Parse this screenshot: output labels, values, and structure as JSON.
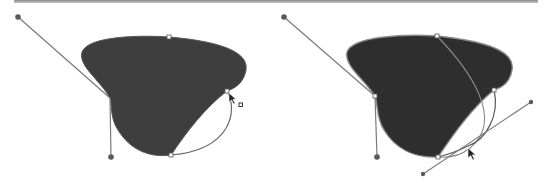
{
  "diagram": {
    "colors": {
      "fill": "#3e3e3e",
      "stroke": "#6a6a6a",
      "handle_dot": "#5a5a5a",
      "anchor": "#ffffff",
      "background": "#ffffff",
      "top_rule": "#9a9a9a"
    },
    "panels": [
      {
        "id": "before",
        "label": "Shape with curve segment selected",
        "anchors": [
          {
            "name": "left-anchor",
            "x": 110,
            "y": 98
          },
          {
            "name": "top-anchor",
            "x": 169,
            "y": 37
          },
          {
            "name": "right-anchor",
            "x": 227,
            "y": 91
          },
          {
            "name": "bottom-anchor",
            "x": 171,
            "y": 155
          }
        ],
        "handles": [
          {
            "from": [
              110,
              98
            ],
            "to": [
              18,
              17
            ]
          },
          {
            "from": [
              110,
              98
            ],
            "to": [
              111,
              157
            ]
          }
        ],
        "cursor": {
          "type": "direct-select-with-square",
          "x": 229,
          "y": 93
        }
      },
      {
        "id": "after",
        "label": "Dragging curve segment with direction line",
        "anchors": [
          {
            "name": "left-anchor",
            "x": 375,
            "y": 96
          },
          {
            "name": "top-anchor",
            "x": 437,
            "y": 36
          },
          {
            "name": "right-anchor",
            "x": 494,
            "y": 90
          },
          {
            "name": "bottom-anchor",
            "x": 438,
            "y": 157
          }
        ],
        "handles": [
          {
            "from": [
              375,
              96
            ],
            "to": [
              284,
              17
            ]
          },
          {
            "from": [
              375,
              96
            ],
            "to": [
              377,
              157
            ]
          },
          {
            "from": [
              423,
              174
            ],
            "to": [
              531,
              102
            ]
          }
        ],
        "cursor": {
          "type": "direct-select",
          "x": 468,
          "y": 148
        }
      }
    ]
  }
}
